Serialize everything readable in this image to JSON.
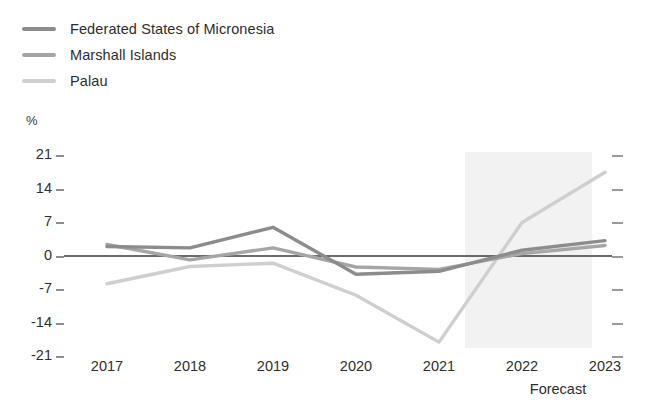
{
  "chart_data": {
    "type": "line",
    "title": "",
    "xlabel": "",
    "ylabel": "%",
    "categories": [
      "2017",
      "2018",
      "2019",
      "2020",
      "2021",
      "2022",
      "2023"
    ],
    "ylim": [
      -21,
      21
    ],
    "yticks": [
      21,
      14,
      7,
      0,
      -7,
      -14,
      -21
    ],
    "grid": false,
    "legend_position": "top-left",
    "zero_line": 0,
    "forecast_start": "2022",
    "forecast_note": "Forecast",
    "series": [
      {
        "name": "Federated States of Micronesia",
        "color": "#8c8c8c",
        "values": [
          2.0,
          1.7,
          6.0,
          -3.8,
          -3.2,
          1.2,
          3.2
        ]
      },
      {
        "name": "Marshall Islands",
        "color": "#a6a6a6",
        "values": [
          2.4,
          -0.8,
          1.7,
          -2.3,
          -2.8,
          0.5,
          2.2
        ]
      },
      {
        "name": "Palau",
        "color": "#cfcfcf",
        "values": [
          -5.8,
          -2.2,
          -1.5,
          -8.2,
          -18.0,
          7.0,
          17.5
        ]
      }
    ]
  },
  "legend": {
    "items": [
      {
        "label": "Federated States of Micronesia",
        "color": "#8c8c8c"
      },
      {
        "label": "Marshall Islands",
        "color": "#a6a6a6"
      },
      {
        "label": "Palau",
        "color": "#cfcfcf"
      }
    ]
  },
  "axes": {
    "y_unit": "%",
    "y_labels": [
      "21",
      "14",
      "7",
      "0",
      "-7",
      "-14",
      "-21"
    ],
    "x_labels": [
      "2017",
      "2018",
      "2019",
      "2020",
      "2021",
      "2022",
      "2023"
    ],
    "forecast_label": "Forecast"
  },
  "colors": {
    "zero_line": "#3a3a3a",
    "forecast_band": "#f2f2f2",
    "tick": "#8d8d8d",
    "text": "#2e2e2e"
  }
}
